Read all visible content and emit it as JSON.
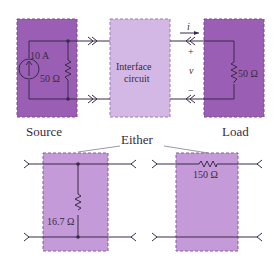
{
  "colors": {
    "source_fill": "#9a5fb4",
    "load_fill": "#9a5fb4",
    "interface_fill": "#d3b7e5",
    "either_fill": "#c49ad8",
    "wire": "#3a2a4a",
    "border": "#7a4a90"
  },
  "source": {
    "label": "Source",
    "current": "10 A",
    "resistance": "50 Ω"
  },
  "interface": {
    "line1": "Interface",
    "line2": "circuit"
  },
  "load": {
    "label": "Load",
    "resistance": "50 Ω",
    "current_symbol": "i",
    "plus": "+",
    "voltage_symbol": "v",
    "minus": "−"
  },
  "either": {
    "label": "Either",
    "option_shunt": {
      "resistance": "16.7 Ω"
    },
    "option_series": {
      "resistance": "150 Ω"
    }
  }
}
